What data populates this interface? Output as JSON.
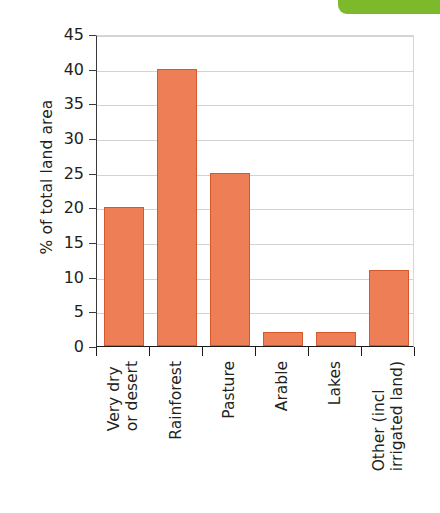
{
  "decoration": {
    "green_tab_color": "#7cb92b"
  },
  "chart_data": {
    "type": "bar",
    "title": "",
    "subtitle": "",
    "xlabel": "",
    "ylabel": "% of total land area",
    "ylim": [
      0,
      45
    ],
    "ytick_step": 5,
    "ytick_labels": [
      "0",
      "5",
      "10",
      "15",
      "20",
      "25",
      "30",
      "35",
      "40",
      "45"
    ],
    "ytick_values": [
      0,
      5,
      10,
      15,
      20,
      25,
      30,
      35,
      40,
      45
    ],
    "grid": true,
    "grid_axis": "y",
    "legend": false,
    "legend_position": "none",
    "bar_color": "#ee7e55",
    "bar_edge_color": "#d4582c",
    "categories": [
      "Very dry or desert",
      "Rainforest",
      "Pasture",
      "Arable",
      "Lakes",
      "Other (incl irrigated land)"
    ],
    "category_label_lines": [
      [
        "Very dry",
        "or desert"
      ],
      [
        "Rainforest"
      ],
      [
        "Pasture"
      ],
      [
        "Arable"
      ],
      [
        "Lakes"
      ],
      [
        "Other (incl",
        "irrigated land)"
      ]
    ],
    "values": [
      20,
      40,
      25,
      2,
      2,
      11
    ],
    "value_unit": "% of total land area",
    "annotations": []
  }
}
